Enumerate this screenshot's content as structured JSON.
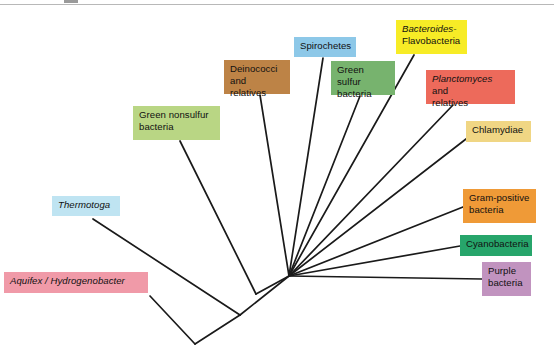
{
  "figure": {
    "type": "phylogenetic-tree",
    "kind": "unrooted radial cladogram",
    "background_color": "#ffffff",
    "branch_color": "#1a1a1a"
  },
  "taxa": [
    {
      "id": "aquifex",
      "label_parts": [
        {
          "text": "Aquifex / Hydrogenobacter",
          "italic": true
        }
      ],
      "plain_label": "Aquifex / Hydrogenobacter",
      "color": "#f09aa8",
      "box": {
        "x": 4,
        "y": 272,
        "w": 144,
        "h": 21
      },
      "tip": {
        "x": 150,
        "y": 296
      }
    },
    {
      "id": "thermotoga",
      "label_parts": [
        {
          "text": "Thermotoga",
          "italic": true
        }
      ],
      "plain_label": "Thermotoga",
      "color": "#bfe4f2",
      "box": {
        "x": 52,
        "y": 196,
        "w": 68,
        "h": 20
      },
      "tip": {
        "x": 93,
        "y": 219
      }
    },
    {
      "id": "green-nonsulfur",
      "label_parts": [
        {
          "text": "Green nonsulfur\nbacteria",
          "italic": false
        }
      ],
      "plain_label": "Green nonsulfur bacteria",
      "color": "#b9d684",
      "box": {
        "x": 133,
        "y": 106,
        "w": 87,
        "h": 34
      },
      "tip": {
        "x": 180,
        "y": 141
      }
    },
    {
      "id": "deinococci",
      "label_parts": [
        {
          "text": "Deinococci\nand relatives",
          "italic": false
        }
      ],
      "plain_label": "Deinococci and relatives",
      "color": "#bd8346",
      "box": {
        "x": 224,
        "y": 60,
        "w": 66,
        "h": 34
      },
      "tip": {
        "x": 260,
        "y": 95
      }
    },
    {
      "id": "spirochetes",
      "label_parts": [
        {
          "text": "Spirochetes",
          "italic": false
        }
      ],
      "plain_label": "Spirochetes",
      "color": "#8dc8e8",
      "box": {
        "x": 294,
        "y": 37,
        "w": 62,
        "h": 20
      },
      "tip": {
        "x": 323,
        "y": 58
      }
    },
    {
      "id": "green-sulfur",
      "label_parts": [
        {
          "text": "Green sulfur\nbacteria",
          "italic": false
        }
      ],
      "plain_label": "Green sulfur bacteria",
      "color": "#77b36e",
      "box": {
        "x": 331,
        "y": 61,
        "w": 64,
        "h": 34
      },
      "tip": {
        "x": 360,
        "y": 96
      }
    },
    {
      "id": "bacteroides",
      "label_parts": [
        {
          "text": "Bacteroides-",
          "italic": true
        },
        {
          "text": "\nFlavobacteria",
          "italic": false
        }
      ],
      "plain_label": "Bacteroides-Flavobacteria",
      "color": "#f7ec26",
      "box": {
        "x": 396,
        "y": 20,
        "w": 71,
        "h": 34
      },
      "tip": {
        "x": 414,
        "y": 55
      }
    },
    {
      "id": "planctomyces",
      "label_parts": [
        {
          "text": "Planctomyces",
          "italic": true
        },
        {
          "text": " and\nrelatives",
          "italic": false
        }
      ],
      "plain_label": "Planctomyces and relatives",
      "color": "#ed6a5b",
      "box": {
        "x": 426,
        "y": 70,
        "w": 89,
        "h": 34
      },
      "tip": {
        "x": 453,
        "y": 105
      }
    },
    {
      "id": "chlamydiae",
      "label_parts": [
        {
          "text": "Chlamydiae",
          "italic": false
        }
      ],
      "plain_label": "Chlamydiae",
      "color": "#f0d684",
      "box": {
        "x": 466,
        "y": 121,
        "w": 65,
        "h": 21
      },
      "tip": {
        "x": 466,
        "y": 139
      }
    },
    {
      "id": "gram-positive",
      "label_parts": [
        {
          "text": "Gram-positive\nbacteria",
          "italic": false
        }
      ],
      "plain_label": "Gram-positive bacteria",
      "color": "#ef9a37",
      "box": {
        "x": 463,
        "y": 189,
        "w": 73,
        "h": 34
      },
      "tip": {
        "x": 463,
        "y": 207
      }
    },
    {
      "id": "cyanobacteria",
      "label_parts": [
        {
          "text": "Cyanobacteria",
          "italic": false
        }
      ],
      "plain_label": "Cyanobacteria",
      "color": "#27a56b",
      "box": {
        "x": 460,
        "y": 235,
        "w": 72,
        "h": 21
      },
      "tip": {
        "x": 460,
        "y": 246
      }
    },
    {
      "id": "purple",
      "label_parts": [
        {
          "text": "Purple\nbacteria",
          "italic": false
        }
      ],
      "plain_label": "Purple bacteria",
      "color": "#c193bf",
      "box": {
        "x": 482,
        "y": 262,
        "w": 49,
        "h": 34
      },
      "tip": {
        "x": 482,
        "y": 279
      }
    }
  ],
  "nodes": {
    "hub": {
      "x": 289,
      "y": 276
    },
    "deep_fork": {
      "x": 195,
      "y": 344
    },
    "thermo_node": {
      "x": 240,
      "y": 315
    },
    "nonsulfur_node": {
      "x": 256,
      "y": 294
    }
  },
  "branches": [
    {
      "name": "hub-to-thermo-node",
      "from": "hub",
      "to": "thermo_node"
    },
    {
      "name": "thermo-node-to-deep-fork",
      "from": "thermo_node",
      "to": "deep_fork"
    },
    {
      "name": "deep-fork-to-aquifex",
      "from": "deep_fork",
      "to": "aquifex"
    },
    {
      "name": "thermo-node-to-thermotoga",
      "from": "thermo_node",
      "to": "thermotoga"
    },
    {
      "name": "hub-to-nonsulfur-node",
      "from": "hub",
      "to": "nonsulfur_node"
    },
    {
      "name": "nonsulfur-node-to-green-nonsulfur",
      "from": "nonsulfur_node",
      "to": "green-nonsulfur"
    },
    {
      "name": "hub-to-deinococci",
      "from": "hub",
      "to": "deinococci"
    },
    {
      "name": "hub-to-spirochetes",
      "from": "hub",
      "to": "spirochetes"
    },
    {
      "name": "hub-to-green-sulfur",
      "from": "hub",
      "to": "green-sulfur"
    },
    {
      "name": "hub-to-bacteroides",
      "from": "hub",
      "to": "bacteroides"
    },
    {
      "name": "hub-to-planctomyces",
      "from": "hub",
      "to": "planctomyces"
    },
    {
      "name": "hub-to-chlamydiae",
      "from": "hub",
      "to": "chlamydiae"
    },
    {
      "name": "hub-to-gram-positive",
      "from": "hub",
      "to": "gram-positive"
    },
    {
      "name": "hub-to-cyanobacteria",
      "from": "hub",
      "to": "cyanobacteria"
    },
    {
      "name": "hub-to-purple",
      "from": "hub",
      "to": "purple"
    }
  ]
}
